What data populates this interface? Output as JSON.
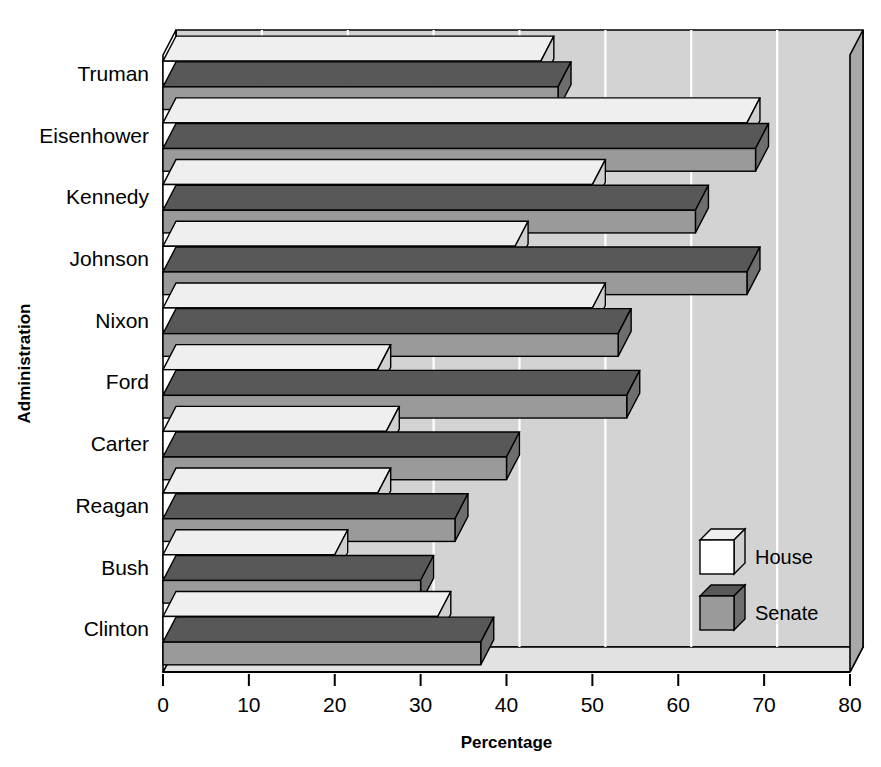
{
  "chart_data": {
    "type": "bar",
    "orientation": "horizontal",
    "title": "",
    "xlabel": "Percentage",
    "ylabel": "Administration",
    "categories": [
      "Truman",
      "Eisenhower",
      "Kennedy",
      "Johnson",
      "Nixon",
      "Ford",
      "Carter",
      "Reagan",
      "Bush",
      "Clinton"
    ],
    "series": [
      {
        "name": "House",
        "values": [
          44,
          68,
          50,
          41,
          50,
          25,
          26,
          25,
          20,
          32
        ],
        "color": "#ffffff"
      },
      {
        "name": "Senate",
        "values": [
          46,
          69,
          62,
          68,
          53,
          54,
          40,
          34,
          30,
          37
        ],
        "color": "#9a9a9a"
      }
    ],
    "xlim": [
      0,
      80
    ],
    "xticks": [
      0,
      10,
      20,
      30,
      40,
      50,
      60,
      70,
      80
    ],
    "xtick_labels": [
      "0",
      "10",
      "20",
      "30",
      "40",
      "50",
      "60",
      "70",
      "80"
    ],
    "grid": true,
    "grid_color": "#ffffff",
    "legend_position": "inside-lower-right",
    "style": "3d",
    "plot_background": "#d3d3d3"
  },
  "legend": {
    "entries": [
      {
        "label": "House",
        "swatch": "white-cube-icon"
      },
      {
        "label": "Senate",
        "swatch": "gray-cube-icon"
      }
    ]
  },
  "colors": {
    "wall": "#d3d3d3",
    "wall_side": "#a8a8a8",
    "floor": "#e2e2e2",
    "house_fill": "#ffffff",
    "house_top": "#efefef",
    "house_side": "#cfcfcf",
    "senate_fill": "#9a9a9a",
    "senate_top": "#585858",
    "senate_side": "#6e6e6e",
    "outline": "#000000",
    "grid": "#ffffff"
  }
}
